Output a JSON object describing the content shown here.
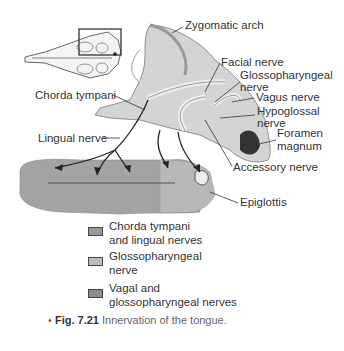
{
  "figure": {
    "labels": {
      "zygomatic_arch": "Zygomatic arch",
      "facial_nerve": "Facial nerve",
      "glossopharyngeal_nerve_1": "Glossopharyngeal",
      "glossopharyngeal_nerve_2": "nerve",
      "vagus_nerve": "Vagus nerve",
      "hypoglossal_nerve_1": "Hypoglossal",
      "hypoglossal_nerve_2": "nerve",
      "foramen_magnum_1": "Foramen",
      "foramen_magnum_2": "magnum",
      "accessory_nerve": "Accessory nerve",
      "epiglottis": "Epiglottis",
      "chorda_tympani": "Chorda tympani",
      "lingual_nerve": "Lingual nerve"
    },
    "legend": [
      {
        "line1": "Chorda tympani",
        "line2": "and lingual nerves",
        "color": "#9a9a9a"
      },
      {
        "line1": "Glossopharyngeal",
        "line2": "nerve",
        "color": "#bdbdbd"
      },
      {
        "line1": "Vagal and",
        "line2": "glossopharyngeal nerves",
        "color": "#8c8c8c"
      }
    ],
    "caption": {
      "bullet": "•",
      "number": "Fig. 7.21",
      "text": "Innervation of the tongue."
    },
    "colors": {
      "tongue_front": "#a3a3a3",
      "tongue_back": "#b8b8b8",
      "skull": "#d4d4d4",
      "ink": "#2a2a2a"
    }
  }
}
